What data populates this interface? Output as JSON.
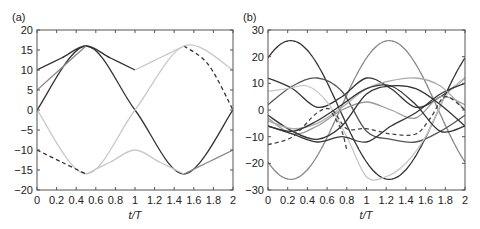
{
  "chart_data": [
    {
      "type": "line",
      "panel_label": "(a)",
      "xlabel": "t/T",
      "ylabel": "",
      "xlim": [
        0,
        2
      ],
      "ylim": [
        -20,
        20
      ],
      "xticks": [
        "0",
        "0.2",
        "0.4",
        "0.6",
        "0.8",
        "1",
        "1.2",
        "1.4",
        "1.6",
        "1.8",
        "2"
      ],
      "yticks": [
        "20",
        "15",
        "10",
        "5",
        "0",
        "−10",
        "−5",
        "−15",
        "−20"
      ],
      "ytick_values": [
        20,
        15,
        10,
        5,
        0,
        -10,
        -5,
        -15,
        -20
      ],
      "grid": false,
      "series": [
        {
          "name": "upper-envelope-dark",
          "color": "#333333",
          "dash": false,
          "x": [
            0,
            0.25,
            0.5,
            0.75,
            1
          ],
          "y": [
            10,
            13,
            16,
            13,
            10
          ]
        },
        {
          "name": "upper-envelope-light",
          "color": "#c8c8c8",
          "dash": false,
          "x": [
            1,
            1.25,
            1.5
          ],
          "y": [
            10,
            13,
            16
          ]
        },
        {
          "name": "upper-envelope-dashed",
          "color": "#333333",
          "dash": true,
          "x": [
            1.5,
            1.75,
            2
          ],
          "y": [
            16,
            11.3,
            0
          ]
        },
        {
          "name": "sine-dark",
          "color": "#333333",
          "dash": false,
          "x": [
            0,
            0.5,
            1,
            1.5,
            2
          ],
          "y": [
            0,
            16,
            0,
            -16,
            0
          ]
        },
        {
          "name": "sine-light",
          "color": "#c8c8c8",
          "dash": false,
          "x": [
            0,
            0.5,
            1,
            1.5,
            2
          ],
          "y": [
            0,
            -16,
            0,
            16,
            10
          ]
        },
        {
          "name": "mid-gray-rise",
          "color": "#888888",
          "dash": false,
          "x": [
            0,
            0.5
          ],
          "y": [
            5,
            16
          ]
        },
        {
          "name": "lower-envelope-dashed",
          "color": "#333333",
          "dash": true,
          "x": [
            0,
            0.25,
            0.5
          ],
          "y": [
            -10,
            -13,
            -16
          ]
        },
        {
          "name": "lower-envelope-light",
          "color": "#c8c8c8",
          "dash": false,
          "x": [
            0.5,
            0.75,
            1,
            1.25,
            1.5
          ],
          "y": [
            -16,
            -13,
            -10,
            -13,
            -16
          ]
        },
        {
          "name": "lower-envelope-gray",
          "color": "#888888",
          "dash": false,
          "x": [
            1.5,
            1.75,
            2
          ],
          "y": [
            -16,
            -13,
            -10
          ]
        }
      ]
    },
    {
      "type": "line",
      "panel_label": "(b)",
      "xlabel": "t/T",
      "ylabel": "",
      "xlim": [
        0,
        2
      ],
      "ylim": [
        -30,
        30
      ],
      "xticks": [
        "0",
        "0.2",
        "0.4",
        "0.6",
        "0.8",
        "1",
        "1.2",
        "1.4",
        "1.6",
        "1.8",
        "2"
      ],
      "yticks": [
        "30",
        "20",
        "10",
        "0",
        "−10",
        "−20",
        "−30"
      ],
      "ytick_values": [
        30,
        20,
        10,
        0,
        -10,
        -20,
        -30
      ],
      "grid": false,
      "series": [
        {
          "name": "s1",
          "color": "#333333",
          "dash": false,
          "amp": 26,
          "phase": 0.23,
          "offset": 0,
          "note": "20 at t=0, peak 26 near t=0.23, -20 at t=2"
        },
        {
          "name": "s2",
          "color": "#888888",
          "dash": false,
          "amp": 26,
          "phase": 1.23,
          "offset": 0,
          "note": "-20 at t=0, trough -26 near 0.23, peak 26 near 1.23"
        },
        {
          "name": "s3",
          "color": "#333333",
          "dash": false,
          "x": [
            0,
            0.25,
            0.5,
            0.75,
            1,
            1.25,
            1.5,
            1.75,
            2
          ],
          "y": [
            12,
            8,
            1,
            5,
            12,
            8,
            1,
            5,
            12
          ]
        },
        {
          "name": "s4",
          "color": "#555555",
          "dash": false,
          "x": [
            0,
            0.25,
            0.5,
            0.75,
            1,
            1.25,
            1.5,
            1.75,
            2
          ],
          "y": [
            2,
            9,
            12,
            7,
            -8,
            -11,
            -12,
            -8,
            -2
          ]
        },
        {
          "name": "s5",
          "color": "#c8c8c8",
          "dash": false,
          "x": [
            0,
            0.2,
            0.4,
            0.6,
            0.8,
            1,
            1.2,
            1.4,
            1.6,
            1.8,
            2
          ],
          "y": [
            7,
            8,
            9,
            3,
            -10,
            -25,
            -25,
            -20,
            -10,
            5,
            12
          ]
        },
        {
          "name": "s6",
          "color": "#999999",
          "dash": false,
          "x": [
            0,
            0.25,
            0.5,
            0.75,
            1,
            1.25,
            1.5,
            1.75,
            2
          ],
          "y": [
            -3,
            -9,
            -6,
            0,
            3,
            0,
            -3,
            5,
            2
          ]
        },
        {
          "name": "s7",
          "color": "#333333",
          "dash": false,
          "x": [
            0,
            0.25,
            0.5,
            0.75,
            1,
            1.25,
            1.5,
            1.75,
            2
          ],
          "y": [
            -2,
            -8,
            -11,
            -6,
            6,
            9,
            8,
            2,
            -6
          ]
        },
        {
          "name": "s8",
          "color": "#333333",
          "dash": false,
          "x": [
            0,
            0.25,
            0.5,
            0.75,
            1,
            1.25,
            1.5,
            1.75,
            2
          ],
          "y": [
            -6,
            -9,
            -12,
            -10,
            -12,
            -6,
            -1,
            6,
            10
          ]
        },
        {
          "name": "s9",
          "color": "#aaaaaa",
          "dash": false,
          "x": [
            0,
            0.25,
            0.5,
            0.75,
            1,
            1.25,
            1.5,
            1.75,
            2
          ],
          "y": [
            -4,
            -7,
            -5,
            1,
            8,
            11,
            12,
            9,
            0
          ]
        },
        {
          "name": "s10",
          "color": "#333333",
          "dash": false,
          "x": [
            0,
            0.25,
            0.5,
            0.75,
            1,
            1.25,
            1.5,
            1.75,
            2
          ],
          "y": [
            -6,
            -8,
            -4,
            2,
            8,
            9,
            2,
            -8,
            -6
          ]
        },
        {
          "name": "dashed-1",
          "color": "#444444",
          "dash": true,
          "x": [
            0,
            0.25,
            0.5,
            0.65,
            0.8,
            1,
            1.25,
            1.5,
            1.65,
            1.8,
            2
          ],
          "y": [
            -13,
            -10,
            -1,
            0,
            -7,
            -7,
            -9,
            -9,
            -3,
            5,
            0
          ]
        },
        {
          "name": "dashed-2",
          "color": "#444444",
          "dash": true,
          "x": [
            0.65,
            0.75,
            0.8
          ],
          "y": [
            -1,
            -8,
            -15
          ]
        }
      ]
    }
  ]
}
